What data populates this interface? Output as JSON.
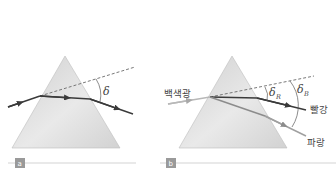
{
  "panels": [
    {
      "id": "a",
      "label": "a",
      "deviation_symbol": "δ"
    },
    {
      "id": "b",
      "label": "b",
      "incident_label": "백색광",
      "red_label": "빨강",
      "blue_label": "파랑",
      "deviation_red_symbol": "δ",
      "deviation_red_sub": "R",
      "deviation_blue_symbol": "δ",
      "deviation_blue_sub": "B"
    }
  ],
  "colors": {
    "prism_light": "#e6e6e6",
    "prism_dark": "#c4c4c4",
    "ray_dark": "#3a3a3a",
    "ray_light": "#a8a8a8",
    "blue_ray": "#8c8c8c",
    "dashed": "#6a6a6a",
    "rule": "#c8c8c8",
    "badge": "#9a9a9a"
  }
}
